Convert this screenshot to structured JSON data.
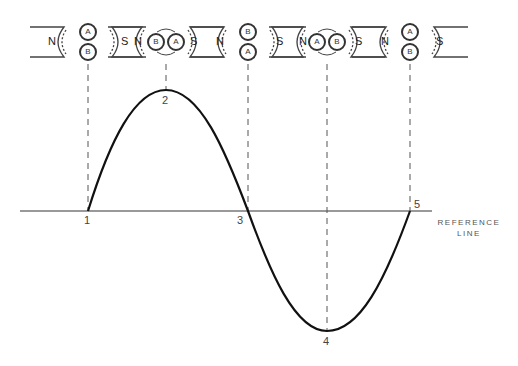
{
  "diagram": {
    "type": "ac-generator-sine-wave",
    "reference_line": {
      "label_line1": "REFERENCE",
      "label_line2": "LINE",
      "y": 211,
      "x_start": 20,
      "x_end": 430
    },
    "points": [
      {
        "id": "1",
        "label": "1",
        "x": 88,
        "y": 211,
        "position": "zero"
      },
      {
        "id": "2",
        "label": "2",
        "x": 166,
        "y": 90,
        "position": "positive-peak"
      },
      {
        "id": "3",
        "label": "3",
        "x": 248,
        "y": 211,
        "position": "zero"
      },
      {
        "id": "4",
        "label": "4",
        "x": 327,
        "y": 331,
        "position": "negative-peak"
      },
      {
        "id": "5",
        "label": "5",
        "x": 410,
        "y": 211,
        "position": "zero"
      }
    ],
    "magnets": [
      {
        "cx": 88,
        "north": "N",
        "south": "S",
        "coil_top": "A",
        "coil_bottom": "B",
        "orientation": "vertical"
      },
      {
        "cx": 166,
        "north": "N",
        "south": "S",
        "coil_left": "B",
        "coil_right": "A",
        "orientation": "horizontal"
      },
      {
        "cx": 248,
        "north": "N",
        "south": "S",
        "coil_top": "B",
        "coil_bottom": "A",
        "orientation": "vertical"
      },
      {
        "cx": 327,
        "north": "N",
        "south": "S",
        "coil_left": "A",
        "coil_right": "B",
        "orientation": "horizontal"
      },
      {
        "cx": 410,
        "north": "N",
        "south": "S",
        "coil_top": "A",
        "coil_bottom": "B",
        "orientation": "vertical"
      }
    ],
    "colors": {
      "curve": "#111111",
      "reference": "#666666",
      "dashed": "#555555",
      "text": "#444444"
    }
  }
}
